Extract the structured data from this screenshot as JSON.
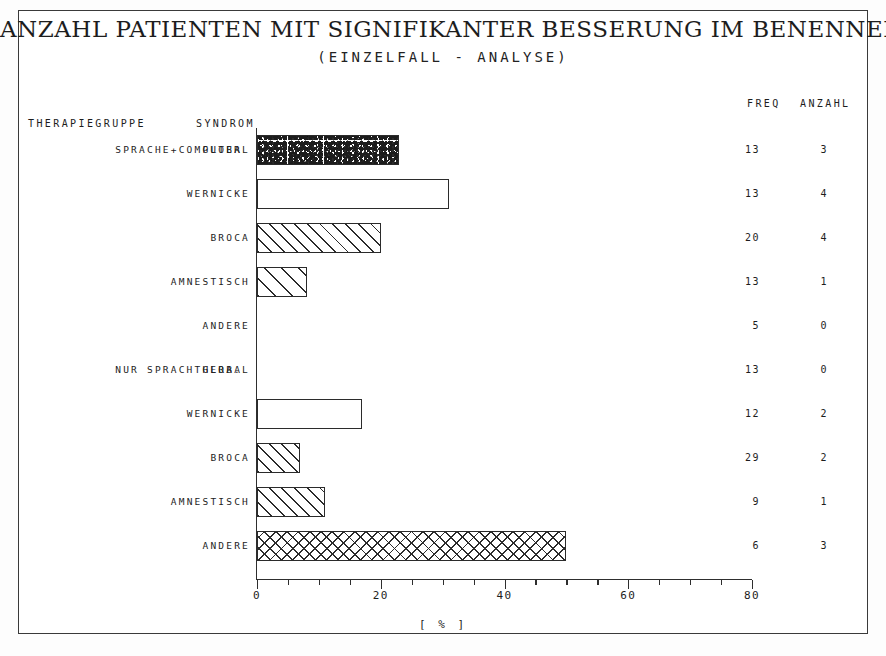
{
  "title": "ANZAHL PATIENTEN MIT SIGNIFIKANTER BESSERUNG IM BENENNEN",
  "subtitle": "(EINZELFALL  -  ANALYSE)",
  "headers": {
    "therapiegruppe": "THERAPIEGRUPPE",
    "syndrom": "SYNDROM",
    "freq": "FREQ",
    "anzahl": "ANZAHL"
  },
  "groups": [
    {
      "label": "SPRACHE+COMPUTER"
    },
    {
      "label": "NUR SPRACHTHERA."
    }
  ],
  "chart_data": {
    "type": "bar",
    "orientation": "horizontal",
    "title": "ANZAHL PATIENTEN MIT SIGNIFIKANTER BESSERUNG IM BENENNEN",
    "subtitle": "(EINZELFALL  -  ANALYSE)",
    "xlabel": "[ % ]",
    "ylabel": "",
    "xlim": [
      0,
      80
    ],
    "xticks": [
      0,
      20,
      40,
      60,
      80
    ],
    "xticklabels": [
      "0",
      "20",
      "40",
      "60",
      "80"
    ],
    "minor_tick_step": 5,
    "grid": false,
    "legend": false,
    "rows": [
      {
        "group": "SPRACHE+COMPUTER",
        "category": "GLOBAL",
        "value": 23,
        "freq": 13,
        "anzahl": 3,
        "pattern": "speckle"
      },
      {
        "group": "SPRACHE+COMPUTER",
        "category": "WERNICKE",
        "value": 31,
        "freq": 13,
        "anzahl": 4,
        "pattern": "none"
      },
      {
        "group": "SPRACHE+COMPUTER",
        "category": "BROCA",
        "value": 20,
        "freq": 20,
        "anzahl": 4,
        "pattern": "hatch"
      },
      {
        "group": "SPRACHE+COMPUTER",
        "category": "AMNESTISCH",
        "value": 8,
        "freq": 13,
        "anzahl": 1,
        "pattern": "hatch-wide"
      },
      {
        "group": "SPRACHE+COMPUTER",
        "category": "ANDERE",
        "value": 0,
        "freq": 5,
        "anzahl": 0,
        "pattern": "none"
      },
      {
        "group": "NUR SPRACHTHERA.",
        "category": "GLOBAL",
        "value": 0,
        "freq": 13,
        "anzahl": 0,
        "pattern": "none"
      },
      {
        "group": "NUR SPRACHTHERA.",
        "category": "WERNICKE",
        "value": 17,
        "freq": 12,
        "anzahl": 2,
        "pattern": "none"
      },
      {
        "group": "NUR SPRACHTHERA.",
        "category": "BROCA",
        "value": 7,
        "freq": 29,
        "anzahl": 2,
        "pattern": "hatch"
      },
      {
        "group": "NUR SPRACHTHERA.",
        "category": "AMNESTISCH",
        "value": 11,
        "freq": 9,
        "anzahl": 1,
        "pattern": "hatch"
      },
      {
        "group": "NUR SPRACHTHERA.",
        "category": "ANDERE",
        "value": 50,
        "freq": 6,
        "anzahl": 3,
        "pattern": "cross"
      }
    ]
  },
  "colors": {
    "ink": "#2b2b2b",
    "paper": "#ffffff",
    "frame": "#3a3a3a"
  }
}
